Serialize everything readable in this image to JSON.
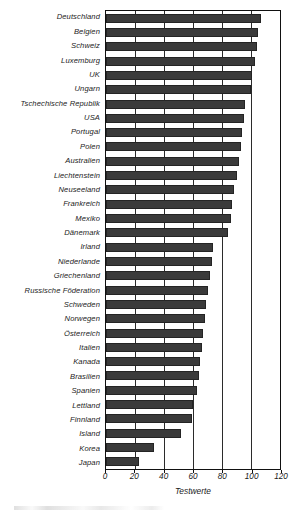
{
  "chart_data": {
    "type": "bar",
    "orientation": "horizontal",
    "title": "",
    "xlabel": "Testwerte",
    "ylabel": "",
    "xlim": [
      0,
      120
    ],
    "xticks": [
      0,
      20,
      40,
      60,
      80,
      100,
      120
    ],
    "grid": true,
    "legend": null,
    "categories": [
      "Deutschland",
      "Belgien",
      "Schweiz",
      "Luxemburg",
      "UK",
      "Ungarn",
      "Tschechische Republik",
      "USA",
      "Portugal",
      "Polen",
      "Australien",
      "Liechtenstein",
      "Neuseeland",
      "Frankreich",
      "Mexiko",
      "Dänemark",
      "Irland",
      "Niederlande",
      "Griechenland",
      "Russische Föderation",
      "Schweden",
      "Norwegen",
      "Österreich",
      "Italien",
      "Kanada",
      "Brasilien",
      "Spanien",
      "Lettland",
      "Finnland",
      "Island",
      "Korea",
      "Japan"
    ],
    "values": [
      107,
      105,
      104,
      103,
      101,
      100,
      96,
      95,
      94,
      93,
      92,
      90,
      88,
      87,
      86,
      84,
      74,
      73,
      72,
      70,
      69,
      68,
      67,
      66,
      65,
      64,
      63,
      60,
      59,
      52,
      33,
      23
    ]
  },
  "axis": {
    "x_tick_labels": [
      "0",
      "20",
      "40",
      "60",
      "80",
      "100",
      "120"
    ],
    "x_axis_title": "Testwerte"
  },
  "style": {
    "bar_color": "#3a3a3a",
    "bar_edge_color": "#242424",
    "axis_color": "#111111",
    "grid_color": "#2b2b2b",
    "background": "#ffffff",
    "text_color": "#1b1b1b"
  }
}
